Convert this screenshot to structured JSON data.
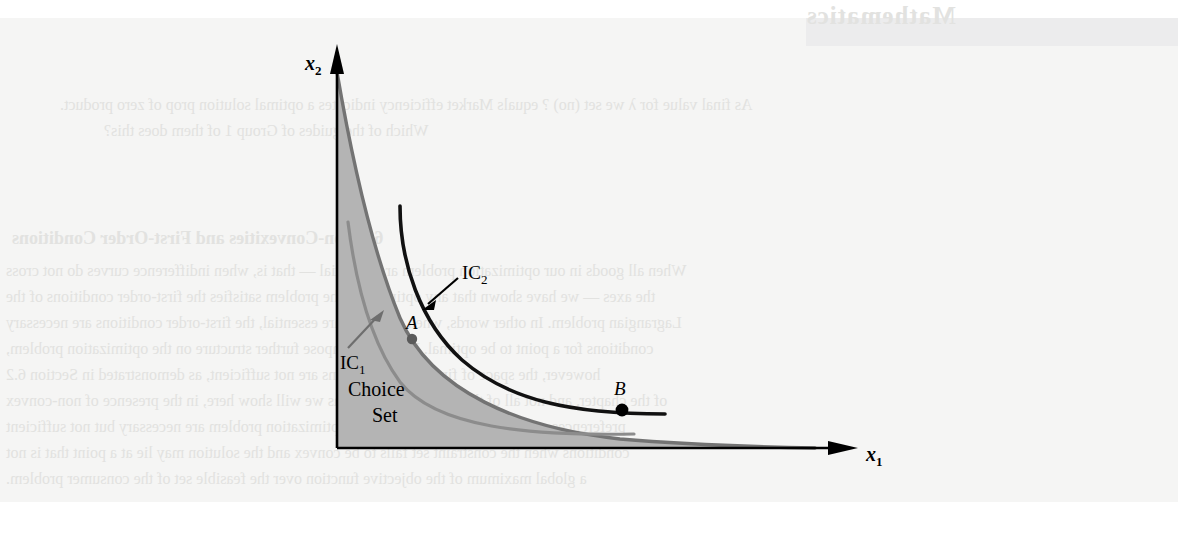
{
  "figure": {
    "kind": "economics-indifference-curve-diagram",
    "axes": {
      "x_label": "x",
      "x_subscript": "1",
      "y_label": "x",
      "y_subscript": "2"
    },
    "curves": [
      {
        "id": "ic1",
        "label": "IC",
        "subscript": "1",
        "color": "#8c8c8c",
        "description": "lower indifference curve, tangent nowhere, interior to choice set"
      },
      {
        "id": "ic2",
        "label": "IC",
        "subscript": "2",
        "color": "#000000",
        "description": "higher indifference curve, tangent to choice set boundary at A and crossing at B"
      },
      {
        "id": "boundary",
        "label": "",
        "subscript": "",
        "color": "#737373",
        "description": "non-convex choice set boundary"
      }
    ],
    "points": [
      {
        "id": "A",
        "label": "A",
        "role": "tangency-point"
      },
      {
        "id": "B",
        "label": "B",
        "role": "true-optimum-point"
      }
    ],
    "region": {
      "line1": "Choice",
      "line2": "Set",
      "fill_color": "#b4b4b4"
    },
    "colors": {
      "paper": "#f5f5f4",
      "ink": "#000000",
      "gray_curve": "#8c8c8c",
      "boundary_gray": "#737373",
      "set_fill": "#b4b4b4",
      "showthrough": "#e2e2e0"
    }
  },
  "showthrough": {
    "title": "Mathematics",
    "q_line1": "As final value for λ we set (no) ? equals Market efficiency indicates a optimal solution prop of zero product.",
    "q_line2": "Which of the guides of Group 1 of them does this?",
    "section": "6.3  Non-Convexities and First-Order Conditions",
    "line1": "When all goods in our optimization problem are essential — that is, when indifference curves do not cross",
    "line2": "the axes — we have shown that any optimum of the problem satisfies the first-order conditions of the",
    "line3": "Lagrangian problem. In other words, when all goods are essential, the first-order conditions are necessary",
    "line4": "conditions for a point to be optimal. Unless we impose further structure on the optimization problem,",
    "line5": "however, the space of first-order conditions are not sufficient, as demonstrated in Section 6.2",
    "line6": "of the chapter, and not all of these are true optima; as we will show here, in the presence of non-convex",
    "line7": "preferences or constraints. The constrained optimization problem are necessary but not sufficient",
    "line8": "conditions when the constraint set fails to be convex and the solution may lie at a point that is not",
    "line9": "a global maximum of the objective function over the feasible set of the consumer problem."
  }
}
